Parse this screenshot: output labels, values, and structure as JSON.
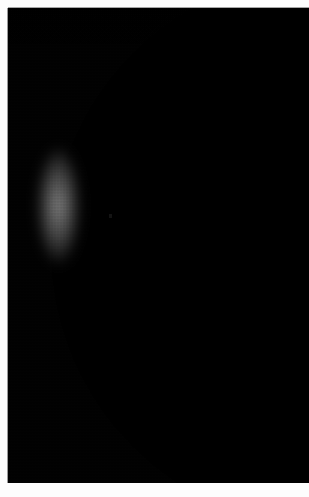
{
  "page": {
    "background_color": "#fdfdfd",
    "width": 309,
    "height": 497
  },
  "photo": {
    "name": "crescent-planet-photograph",
    "medium": "astronomical photograph",
    "sky_color": "#000000",
    "limb_color": "#ffffff",
    "frame": {
      "left": 8,
      "top": 8,
      "width": 301,
      "height": 475
    },
    "margins": {
      "left": 8,
      "top": 8,
      "right": 0,
      "bottom": 14
    },
    "subject": {
      "type": "thin crescent disc",
      "illuminated_limb_side": "left",
      "terminator_side": "right",
      "horn_top_exit_x": 155,
      "horn_bottom_exit_x": 290,
      "widest_crescent_px": 20,
      "widest_crescent_at_y": 200,
      "night_side_color": "#000000"
    }
  },
  "caption": {
    "text": ""
  }
}
